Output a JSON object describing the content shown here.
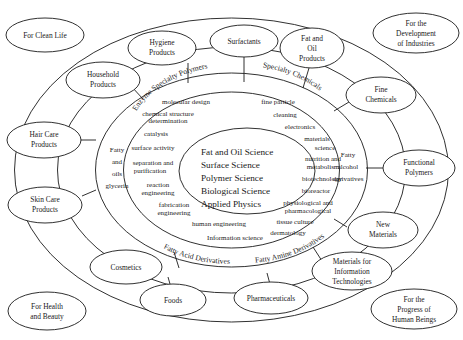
{
  "diagram": {
    "core": {
      "name": "core-sciences",
      "lines": [
        "Fat and Oil Science",
        "Surface Science",
        "Polymer Science",
        "Biological Science",
        "Applied Physics"
      ]
    },
    "technology_ring": {
      "name": "technology-ring",
      "curved_labels": [
        {
          "text": "Enzyme Specialty Polymers",
          "position": "upper-left"
        },
        {
          "text": "Specialty Chemicals",
          "position": "upper-right"
        },
        {
          "text": "Fatty Acid Derivatives",
          "position": "lower-left"
        },
        {
          "text": "Fatty Amine Derivatives",
          "position": "lower-right"
        }
      ],
      "side_labels": [
        {
          "lines": [
            "Fatty",
            "and",
            "oils",
            "glycerin"
          ],
          "position": "left"
        },
        {
          "lines": [
            "Fatty",
            "alcohol",
            "derivatives"
          ],
          "position": "right"
        }
      ],
      "terms_left": [
        "molecular design",
        "chemical structure",
        "determination",
        "catalysis",
        "surface activity",
        "separation and",
        "purification",
        "reaction",
        "engineering",
        "fabrication",
        "engineering",
        "human engineering",
        "Information science"
      ],
      "terms_right": [
        "fine particle",
        "cleaning",
        "electronics",
        "materials",
        "science",
        "nutrition and",
        "metabolism",
        "biotechnology",
        "bioreactor",
        "physiological and",
        "pharmacological",
        "tissue culture",
        "dermatology"
      ]
    },
    "product_nodes": [
      {
        "name": "hygiene-products",
        "lines": [
          "Hygiene",
          "Products"
        ]
      },
      {
        "name": "surfactants",
        "lines": [
          "Surfactants"
        ]
      },
      {
        "name": "fat-and-oil-products",
        "lines": [
          "Fat and",
          "Oil",
          "Products"
        ]
      },
      {
        "name": "household-products",
        "lines": [
          "Household",
          "Products"
        ]
      },
      {
        "name": "fine-chemicals",
        "lines": [
          "Fine",
          "Chemicals"
        ]
      },
      {
        "name": "hair-care-products",
        "lines": [
          "Hair Care",
          "Products"
        ]
      },
      {
        "name": "functional-polymers",
        "lines": [
          "Functional",
          "Polymers"
        ]
      },
      {
        "name": "skin-care-products",
        "lines": [
          "Skin Care",
          "Products"
        ]
      },
      {
        "name": "new-materials",
        "lines": [
          "New",
          "Materials"
        ]
      },
      {
        "name": "cosmetics",
        "lines": [
          "Cosmetics"
        ]
      },
      {
        "name": "materials-for-information-technologies",
        "lines": [
          "Materials for",
          "Information",
          "Technologies"
        ]
      },
      {
        "name": "foods",
        "lines": [
          "Foods"
        ]
      },
      {
        "name": "pharmaceuticals",
        "lines": [
          "Pharmaceuticals"
        ]
      }
    ],
    "purpose_nodes": [
      {
        "name": "for-clean-life",
        "lines": [
          "For Clean Life"
        ]
      },
      {
        "name": "for-the-development-of-industries",
        "lines": [
          "For the",
          "Development",
          "of Industries"
        ]
      },
      {
        "name": "for-health-and-beauty",
        "lines": [
          "For Health",
          "and Beauty"
        ]
      },
      {
        "name": "for-the-progress-of-human-beings",
        "lines": [
          "For the",
          "Progress of",
          "Human Beings"
        ]
      }
    ],
    "colors": {
      "stroke": "#1a1a1a",
      "fill": "#ffffff",
      "background": "#ffffff"
    }
  }
}
